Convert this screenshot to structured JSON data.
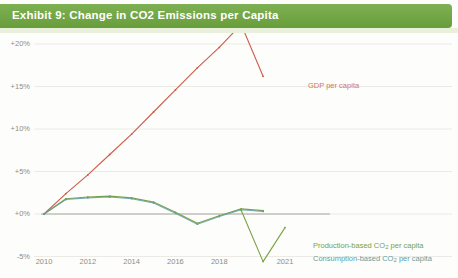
{
  "exhibit": {
    "title": "Exhibit 9: Change in CO2 Emissions per Capita",
    "banner_color": "#6fa73f"
  },
  "annotations": {
    "gdp_label": "GDP per capita",
    "production_label_prefix": "Production-based CO",
    "production_label_sub": "2",
    "production_label_suffix": " per capita",
    "consumption_label_prefix": "Consumption-based CO",
    "consumption_label_sub": "2",
    "consumption_label_suffix": " per capita"
  },
  "chart_data": {
    "type": "line",
    "title": "Exhibit 9: Change in CO2 Emissions per Capita",
    "xlabel": "",
    "ylabel": "",
    "grid": true,
    "legend_position": "right-inline",
    "xlim": [
      2009.5,
      2021.6
    ],
    "ylim": [
      -6.5,
      23
    ],
    "ytick_labels": [
      "+20%",
      "+15%",
      "+10%",
      "+5%",
      "+0%",
      "-5%"
    ],
    "ytick_values": [
      20,
      15,
      10,
      5,
      0,
      -5
    ],
    "xtick_labels": [
      "2010",
      "2012",
      "2014",
      "2016",
      "2018",
      "2021"
    ],
    "xtick_values": [
      2010,
      2012,
      2014,
      2016,
      2018,
      2021
    ],
    "x": [
      2010,
      2011,
      2012,
      2013,
      2014,
      2015,
      2016,
      2017,
      2018,
      2019,
      2020,
      2021
    ],
    "series": [
      {
        "name": "GDP per capita",
        "color": "#cf5b4a",
        "values": [
          0.0,
          2.4,
          4.6,
          7.0,
          9.4,
          12.0,
          14.6,
          17.2,
          19.6,
          22.3,
          16.2,
          null
        ]
      },
      {
        "name": "Production-based CO2 per capita",
        "color": "#7aa245",
        "values": [
          0.0,
          1.8,
          2.0,
          2.1,
          1.9,
          1.4,
          0.2,
          -1.1,
          -0.2,
          0.6,
          0.4,
          null
        ]
      },
      {
        "name": "Consumption-based CO2 per capita",
        "color": "#5f9ea0",
        "values": [
          0.0,
          1.7,
          1.9,
          2.0,
          1.8,
          1.3,
          0.1,
          -1.2,
          -0.3,
          0.5,
          0.3,
          null
        ]
      },
      {
        "name": "Production-based CO2 per capita (tail)",
        "color": "#7aa245",
        "values": [
          null,
          null,
          null,
          null,
          null,
          null,
          null,
          null,
          null,
          0.45,
          -5.6,
          -1.6
        ]
      }
    ],
    "zero_line": 0
  }
}
